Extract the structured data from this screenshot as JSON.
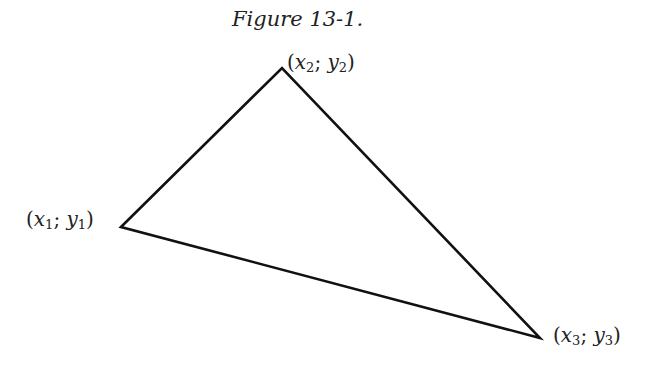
{
  "caption": "Figure 13-1.",
  "vertices": [
    {
      "name": "v1",
      "x": "x",
      "y": "y",
      "sub": "1",
      "sep": "; "
    },
    {
      "name": "v2",
      "x": "x",
      "y": "y",
      "sub": "2",
      "sep": "; "
    },
    {
      "name": "v3",
      "x": "x",
      "y": "y",
      "sub": "3",
      "sep": "; "
    }
  ],
  "triangle": {
    "points": "121,227 282,68 540,338",
    "stroke": "#111111"
  }
}
